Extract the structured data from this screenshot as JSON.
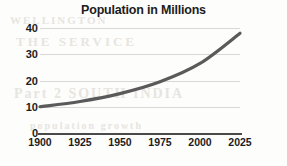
{
  "chart_data": {
    "type": "line",
    "title": "Population in Millions",
    "xlabel": "",
    "ylabel": "",
    "x": [
      1900,
      1925,
      1950,
      1975,
      2000,
      2025
    ],
    "values": [
      10,
      12,
      15,
      19.5,
      26.5,
      38
    ],
    "series": [
      {
        "name": "Population",
        "values": [
          10,
          12,
          15,
          19.5,
          26.5,
          38
        ]
      }
    ],
    "categories": [
      "1900",
      "1925",
      "1950",
      "1975",
      "2000",
      "2025"
    ],
    "xlim": [
      1900,
      2025
    ],
    "ylim": [
      0,
      40
    ],
    "yticks": [
      0,
      10,
      20,
      30,
      40
    ],
    "ytick_labels": [
      "0",
      "10",
      "20",
      "30",
      "40"
    ],
    "xticks": [
      1900,
      1925,
      1950,
      1975,
      2000,
      2025
    ],
    "xtick_labels": [
      "1900",
      "1925",
      "1950",
      "1975",
      "2000",
      "2025"
    ],
    "grid": "horizontal",
    "legend": "none",
    "line_color": "#5a5a5a",
    "gridline_color": "#d8d8d6",
    "axis_color": "#4a4a4a",
    "text_color": "#1c1c1c",
    "background": "#fdfdfc"
  },
  "background_artifacts": {
    "line_a": "WELLINGTON",
    "line_b": "THE SERVICE",
    "line_c": "Part 2 SOUTH INDIA",
    "line_d": "population growth"
  }
}
